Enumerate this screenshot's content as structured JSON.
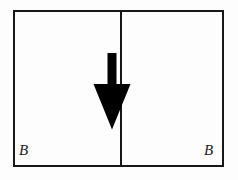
{
  "figure": {
    "background_color": "#fdfdfd",
    "stroke_color": "#171717",
    "fill_color": "#000000",
    "width": 238,
    "height": 180
  },
  "frame": {
    "border_color": "#171717",
    "border_width": 2,
    "divider_x": 120
  },
  "panels": [
    {
      "id": "left",
      "arrow": {
        "direction": "down",
        "icon": "arrow-down-icon",
        "shaft_width": 9,
        "head_width": 36,
        "color": "#000000"
      },
      "corner_label": "B"
    },
    {
      "id": "right",
      "arrow": {
        "direction": "up",
        "icon": "arrow-up-icon",
        "shaft_width": 16,
        "head_width": 34,
        "color": "#000000"
      },
      "corner_label": "B"
    }
  ],
  "labels": {
    "bottom_left": "B",
    "bottom_right": "B"
  }
}
